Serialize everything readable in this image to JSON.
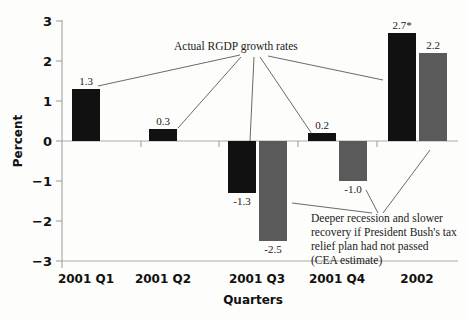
{
  "chart_data": {
    "type": "bar",
    "title": "",
    "xlabel": "Quarters",
    "ylabel": "Percent",
    "ylim": [
      -3,
      3
    ],
    "yticks": [
      "3",
      "2",
      "1",
      "0",
      "-1",
      "-2",
      "-3"
    ],
    "categories": [
      "2001 Q1",
      "2001 Q2",
      "2001 Q3",
      "2001 Q4",
      "2002"
    ],
    "series": [
      {
        "name": "Actual RGDP growth rates",
        "color": "#111111",
        "values": [
          1.3,
          0.3,
          -1.3,
          0.2,
          2.7
        ],
        "labels": [
          "1.3",
          "0.3",
          "-1.3",
          "0.2",
          "2.7*"
        ]
      },
      {
        "name": "Deeper recession and slower recovery if President Bush's tax relief plan had not passed (CEA estimate)",
        "color": "#5a5a5a",
        "values": [
          null,
          null,
          -2.5,
          -1.0,
          2.2
        ],
        "labels": [
          "",
          "",
          "-2.5",
          "-1.0",
          "2.2"
        ]
      }
    ],
    "annotations": [
      "Actual RGDP growth rates",
      "Deeper recession and slower",
      "recovery if President Bush's tax",
      "relief plan had not passed",
      "(CEA estimate)"
    ],
    "grid": false,
    "legend": "none (callout annotations)"
  }
}
